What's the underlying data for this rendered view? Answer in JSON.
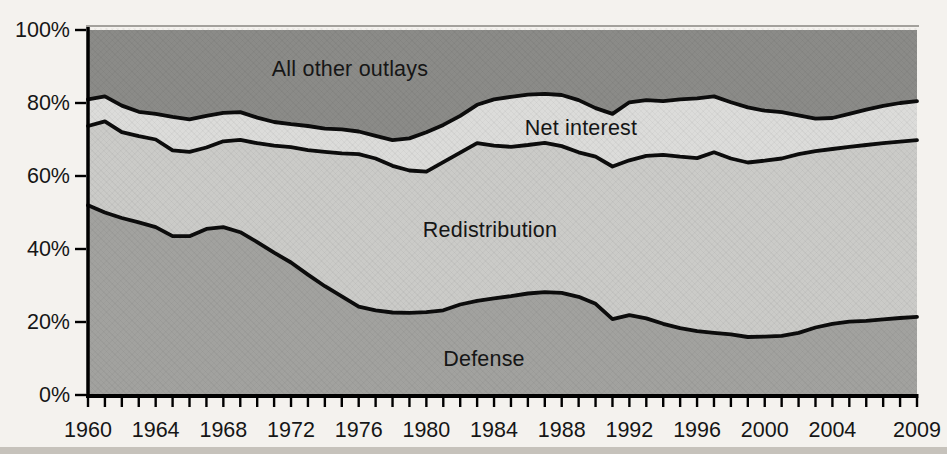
{
  "figure": {
    "background": "#f4f2ee",
    "axis_color": "#000000",
    "line_color": "#0c0c0c",
    "text_color": "#161616",
    "top_rule_color": "#a3a19c",
    "bottom_strip_color": "#c6c2bb"
  },
  "chart_data": {
    "type": "area",
    "stacked": true,
    "title": "",
    "xlabel": "",
    "ylabel": "",
    "ylim": [
      0,
      100
    ],
    "x_years": [
      1960,
      1961,
      1962,
      1963,
      1964,
      1965,
      1966,
      1967,
      1968,
      1969,
      1970,
      1971,
      1972,
      1973,
      1974,
      1975,
      1976,
      1977,
      1978,
      1979,
      1980,
      1981,
      1982,
      1983,
      1984,
      1985,
      1986,
      1987,
      1988,
      1989,
      1990,
      1991,
      1992,
      1993,
      1994,
      1995,
      1996,
      1997,
      1998,
      1999,
      2000,
      2001,
      2002,
      2003,
      2004,
      2005,
      2006,
      2007,
      2008,
      2009
    ],
    "series": [
      {
        "name": "Defense",
        "slug": "defense",
        "color": "#a2a29f",
        "values": [
          52.0,
          50.0,
          48.5,
          47.3,
          46.0,
          43.5,
          43.5,
          45.5,
          46.0,
          44.6,
          41.9,
          39.0,
          36.3,
          33.0,
          29.8,
          27.0,
          24.2,
          23.2,
          22.6,
          22.5,
          22.7,
          23.2,
          24.8,
          25.8,
          26.5,
          27.1,
          27.8,
          28.2,
          28.0,
          26.9,
          25.0,
          20.8,
          21.9,
          21.0,
          19.5,
          18.3,
          17.5,
          17.0,
          16.6,
          15.9,
          16.0,
          16.2,
          17.0,
          18.5,
          19.5,
          20.1,
          20.3,
          20.7,
          21.1,
          21.4
        ]
      },
      {
        "name": "Redistribution",
        "slug": "redistribution",
        "color": "#cbcbc8",
        "values": [
          21.7,
          25.0,
          23.5,
          23.6,
          24.0,
          23.5,
          23.1,
          22.3,
          23.5,
          25.3,
          27.1,
          29.3,
          31.6,
          34.1,
          36.8,
          39.2,
          41.8,
          41.6,
          40.2,
          39.0,
          38.5,
          40.6,
          41.6,
          43.2,
          41.8,
          40.9,
          40.7,
          40.9,
          40.2,
          39.6,
          40.3,
          41.8,
          42.4,
          44.5,
          46.3,
          47.0,
          47.4,
          49.5,
          48.2,
          47.8,
          48.2,
          48.6,
          49.0,
          48.3,
          47.9,
          47.9,
          48.2,
          48.3,
          48.3,
          48.4
        ]
      },
      {
        "name": "Net interest",
        "slug": "net-interest",
        "color": "#dcdcda",
        "values": [
          7.3,
          6.8,
          7.3,
          6.7,
          7.0,
          9.2,
          8.9,
          8.7,
          7.8,
          7.6,
          7.0,
          6.5,
          6.3,
          6.6,
          6.4,
          6.6,
          6.2,
          6.2,
          7.0,
          8.8,
          10.8,
          10.2,
          10.1,
          10.5,
          12.7,
          13.7,
          13.8,
          13.4,
          14.0,
          14.3,
          13.3,
          14.4,
          15.9,
          15.3,
          14.7,
          15.7,
          16.4,
          15.3,
          15.4,
          15.1,
          13.7,
          12.7,
          10.6,
          8.9,
          8.5,
          9.0,
          9.7,
          10.2,
          10.6,
          10.7
        ]
      },
      {
        "name": "All other outlays",
        "slug": "all-other-outlays",
        "color": "#8b8b88",
        "values": [
          19.0,
          18.2,
          20.7,
          22.4,
          23.0,
          23.8,
          24.5,
          23.5,
          22.7,
          22.5,
          24.0,
          25.2,
          25.8,
          26.3,
          27.0,
          27.2,
          27.8,
          29.0,
          30.2,
          29.7,
          28.0,
          26.0,
          23.5,
          20.5,
          19.0,
          18.3,
          17.7,
          17.5,
          17.8,
          19.2,
          21.4,
          23.0,
          19.8,
          19.2,
          19.5,
          19.0,
          18.7,
          18.2,
          19.8,
          21.2,
          22.1,
          22.5,
          23.4,
          24.3,
          24.1,
          23.0,
          21.8,
          20.8,
          20.0,
          19.5
        ]
      }
    ],
    "yticks": [
      {
        "label": "0%",
        "value": 0
      },
      {
        "label": "20%",
        "value": 20
      },
      {
        "label": "40%",
        "value": 40
      },
      {
        "label": "60%",
        "value": 60
      },
      {
        "label": "80%",
        "value": 80
      },
      {
        "label": "100%",
        "value": 100
      }
    ],
    "xtick_labels": [
      {
        "label": "1960",
        "year": 1960
      },
      {
        "label": "1964",
        "year": 1964
      },
      {
        "label": "1968",
        "year": 1968
      },
      {
        "label": "1972",
        "year": 1972
      },
      {
        "label": "1976",
        "year": 1976
      },
      {
        "label": "1980",
        "year": 1980
      },
      {
        "label": "1984",
        "year": 1984
      },
      {
        "label": "1988",
        "year": 1988
      },
      {
        "label": "1992",
        "year": 1992
      },
      {
        "label": "1996",
        "year": 1996
      },
      {
        "label": "2000",
        "year": 2000
      },
      {
        "label": "2004",
        "year": 2004
      },
      {
        "label": "2009",
        "year": 2009
      }
    ],
    "grid": false,
    "legend_position": "labels-inside-areas",
    "minor_xticks_every_year": true
  }
}
